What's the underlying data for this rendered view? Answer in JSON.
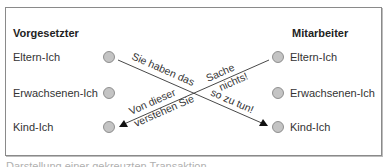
{
  "diagram": {
    "left_column": {
      "title": "Vorgesetzter",
      "states": [
        "Eltern-Ich",
        "Erwachsenen-Ich",
        "Kind-Ich"
      ]
    },
    "right_column": {
      "title": "Mitarbeiter",
      "states": [
        "Eltern-Ich",
        "Erwachsenen-Ich",
        "Kind-Ich"
      ]
    },
    "transactions": [
      {
        "from": "Vorgesetzter Eltern-Ich",
        "to": "Mitarbeiter Kind-Ich",
        "message_part1": "Sie haben das",
        "message_part2": "so zu tun!"
      },
      {
        "from": "Mitarbeiter Eltern-Ich",
        "to": "Vorgesetzter Kind-Ich",
        "message_part1": "Sache",
        "message_part2": "nichts!",
        "message_part3": "Von dieser",
        "message_part4": "verstehen Sie"
      }
    ],
    "colors": {
      "circle_fill": "#c4c4c4",
      "circle_stroke": "#7a7a7a",
      "line": "#333333",
      "frame": "#8a8a8a"
    }
  },
  "caption": "Darstellung einer gekreuzten Transaktion"
}
